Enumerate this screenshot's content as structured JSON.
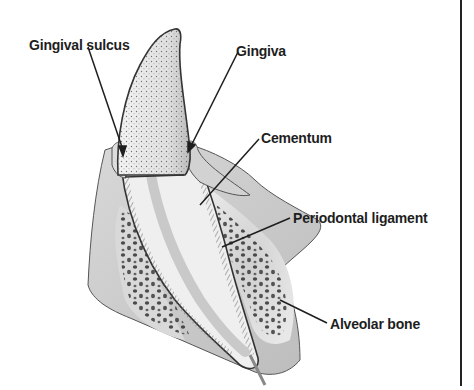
{
  "diagram": {
    "labels": [
      {
        "id": "gingival-sulcus",
        "text": "Gingival sulcus"
      },
      {
        "id": "gingiva",
        "text": "Gingiva"
      },
      {
        "id": "cementum",
        "text": "Cementum"
      },
      {
        "id": "periodontal-ligament",
        "text": "Periodontal ligament"
      },
      {
        "id": "alveolar-bone",
        "text": "Alveolar bone"
      }
    ]
  }
}
